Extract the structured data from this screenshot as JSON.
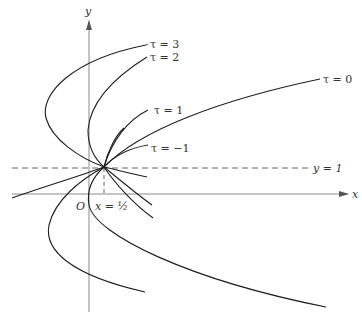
{
  "figure": {
    "axes": {
      "x_label": "x",
      "y_label": "y",
      "origin_label": "O"
    },
    "reference_lines": {
      "horizontal_label": "y = 1",
      "vertical_label": "x = ½"
    },
    "curves": [
      {
        "name": "tau-3",
        "label": "τ = 3"
      },
      {
        "name": "tau-2",
        "label": "τ = 2"
      },
      {
        "name": "tau-1",
        "label": "τ = 1"
      },
      {
        "name": "tau-0",
        "label": "τ = 0"
      },
      {
        "name": "tau-neg1",
        "label": "τ = −1"
      }
    ],
    "colors": {
      "curve": "#1e1e1e",
      "axis": "#8a8a8a",
      "background": "#ffffff"
    }
  }
}
